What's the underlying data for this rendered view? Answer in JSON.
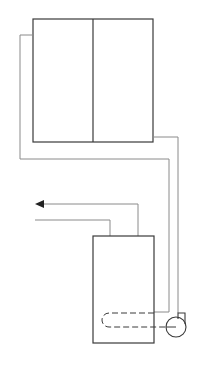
{
  "diagram": {
    "title": "",
    "type": "solar water heating schematic",
    "colors": {
      "outline": "#3a3a3a",
      "pipe": "#8a8a8a",
      "background": "#ffffff"
    },
    "components": [
      {
        "id": "collector-panel",
        "label": "",
        "description": "two-section collector panel"
      },
      {
        "id": "storage-tank",
        "label": "",
        "description": "hot water storage tank"
      },
      {
        "id": "heat-exchanger-coil",
        "label": "",
        "description": "dashed internal coil"
      },
      {
        "id": "pump",
        "label": "",
        "description": "circulation pump"
      },
      {
        "id": "hot-water-outlet",
        "label": "",
        "description": "arrow pointing left"
      },
      {
        "id": "cold-water-inlet",
        "label": "",
        "description": "line entering tank"
      }
    ]
  }
}
